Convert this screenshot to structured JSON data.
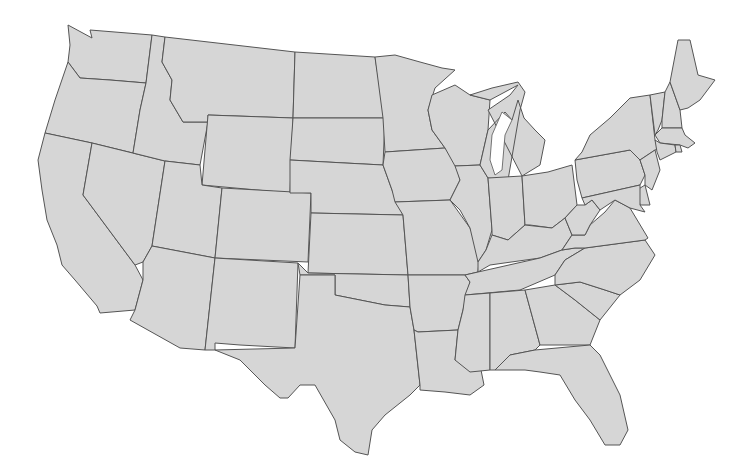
{
  "map": {
    "title": "",
    "fill_color": "#d6d6d6",
    "stroke_color": "#555555",
    "background": "#ffffff",
    "states": [
      {
        "id": "WA",
        "points": "68,25 92,38 90,30 152,35 146,83 110,80 80,78 68,62 70,45"
      },
      {
        "id": "OR",
        "points": "68,62 80,78 110,80 146,83 140,110 133,153 92,143 45,133 55,100"
      },
      {
        "id": "CA",
        "points": "45,133 92,143 83,195 135,265 143,280 135,310 100,313 97,306 75,280 62,265 57,245 47,220 42,190 38,160"
      },
      {
        "id": "NV",
        "points": "92,143 165,161 152,246 143,262 135,265 83,195"
      },
      {
        "id": "ID",
        "points": "152,35 165,37 162,62 172,80 170,100 183,122 208,122 200,165 165,161 133,153 140,110 146,83"
      },
      {
        "id": "MT",
        "points": "165,37 295,52 293,118 208,115 208,122 183,122 170,100 172,80 162,62"
      },
      {
        "id": "WY",
        "points": "208,115 293,118 290,193 202,185"
      },
      {
        "id": "UT",
        "points": "165,161 200,165 202,185 222,188 215,258 152,246"
      },
      {
        "id": "CO",
        "points": "222,188 311,193 308,262 215,258"
      },
      {
        "id": "AZ",
        "points": "152,246 215,258 205,350 180,348 130,320 135,310 143,280 143,262"
      },
      {
        "id": "NM",
        "points": "215,258 298,263 295,348 240,345 215,343 215,350 205,350"
      },
      {
        "id": "ND",
        "points": "295,52 375,57 385,118 293,118"
      },
      {
        "id": "SD",
        "points": "293,118 385,118 383,165 345,163 290,160"
      },
      {
        "id": "NE",
        "points": "290,160 345,163 383,165 392,190 403,215 311,213 311,193 290,193"
      },
      {
        "id": "KS",
        "points": "311,213 403,215 408,275 308,273"
      },
      {
        "id": "OK",
        "points": "298,263 308,273 408,275 410,307 385,305 360,300 335,295 335,275 300,275"
      },
      {
        "id": "TX",
        "points": "300,275 335,275 335,295 360,300 385,305 410,307 414,330 420,385 410,395 385,415 372,430 368,455 355,452 340,440 335,420 315,385 300,385 288,398 280,398 265,385 240,360 215,350 295,348"
      },
      {
        "id": "MN",
        "points": "375,57 395,55 420,62 442,68 455,70 435,88 428,110 432,130 445,148 385,152 383,118"
      },
      {
        "id": "IA",
        "points": "385,152 445,148 455,160 460,180 450,200 395,202 392,190 383,165"
      },
      {
        "id": "MO",
        "points": "395,202 450,200 470,228 480,250 478,272 465,275 408,275 403,215"
      },
      {
        "id": "AR",
        "points": "408,275 465,275 470,282 463,310 458,330 418,332 414,330 410,307"
      },
      {
        "id": "LA",
        "points": "418,332 458,330 455,360 480,365 484,385 470,395 445,392 420,390 420,385 414,330"
      },
      {
        "id": "WI",
        "points": "432,95 455,85 470,95 490,100 488,130 480,165 455,166 445,148 432,130 428,110"
      },
      {
        "id": "IL",
        "points": "455,166 480,165 488,178 492,230 486,250 478,262 470,228 460,210 450,200 460,180"
      },
      {
        "id": "MI",
        "points": "488,110 510,95 518,85 490,100 470,95 492,88 518,82 525,92 520,110 508,180 488,178 480,165 488,130 505,112 512,120 518,100 524,118 535,130 545,140 540,165 522,176"
      },
      {
        "id": "IN",
        "points": "488,178 522,176 525,225 508,240 492,235 492,230"
      },
      {
        "id": "OH",
        "points": "522,176 548,172 572,165 577,205 565,218 552,228 530,225 525,225"
      },
      {
        "id": "KY",
        "points": "492,235 508,240 525,225 552,228 565,218 572,235 562,250 540,258 490,265 478,272 478,262 486,250"
      },
      {
        "id": "TN",
        "points": "478,272 540,258 562,250 575,248 585,248 565,260 555,275 520,290 465,295 470,282 465,275"
      },
      {
        "id": "MS",
        "points": "465,295 490,293 490,370 470,372 455,360 458,330 463,310"
      },
      {
        "id": "AL",
        "points": "490,293 525,290 540,345 535,350 510,355 495,370 490,370"
      },
      {
        "id": "GA",
        "points": "525,290 555,285 575,300 600,320 590,345 545,345 540,345"
      },
      {
        "id": "FL",
        "points": "495,370 510,355 535,350 590,345 600,355 620,395 628,430 620,445 605,445 590,420 575,400 560,375 540,372 525,370"
      },
      {
        "id": "SC",
        "points": "555,285 580,282 605,290 620,295 600,320 575,300"
      },
      {
        "id": "NC",
        "points": "565,260 585,248 645,240 655,255 640,280 620,295 605,290 580,282 555,285 555,275"
      },
      {
        "id": "VA",
        "points": "562,250 572,235 585,235 590,225 605,212 615,200 630,208 648,238 645,240 585,248 575,248"
      },
      {
        "id": "WV",
        "points": "565,218 577,205 585,205 592,200 600,210 590,225 585,235 572,235"
      },
      {
        "id": "PA",
        "points": "575,160 630,150 640,160 645,175 640,185 582,198 577,180"
      },
      {
        "id": "NY",
        "points": "582,152 590,135 610,118 630,98 650,95 655,140 660,148 655,150 640,160 630,150 575,160"
      },
      {
        "id": "NJ",
        "points": "640,160 655,150 660,170 652,190 645,185 645,175"
      },
      {
        "id": "DE",
        "points": "637,190 645,185 650,205 640,205"
      },
      {
        "id": "MD",
        "points": "582,198 640,185 640,205 645,212 630,208 615,200 600,210 592,200 585,205"
      },
      {
        "id": "VT",
        "points": "650,95 665,92 662,120 658,130 655,135"
      },
      {
        "id": "NH",
        "points": "665,92 670,82 680,110 682,128 662,128 662,120"
      },
      {
        "id": "ME",
        "points": "670,82 678,40 690,40 698,75 715,80 700,100 688,108 680,110"
      },
      {
        "id": "MA",
        "points": "655,135 662,128 682,128 685,135 695,143 688,148 680,145 660,143"
      },
      {
        "id": "CT",
        "points": "655,140 660,143 675,145 676,152 660,160 657,152"
      },
      {
        "id": "RI",
        "points": "675,145 680,145 682,152 676,152"
      }
    ],
    "lakes": [
      {
        "id": "lake-michigan",
        "points": "502,112 512,120 505,135 502,170 495,175 490,160 492,135"
      }
    ]
  }
}
